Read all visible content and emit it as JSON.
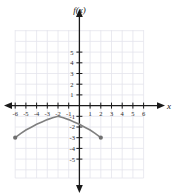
{
  "figure": {
    "title": "f(x)",
    "x_axis_label": "x",
    "background": "#ffffff",
    "grid_color": "#e2e2ea",
    "axis_color": "#1a1a1a",
    "curve_color": "#808080"
  },
  "axes": {
    "x_ticks": [
      "-6",
      "-5",
      "-4",
      "-3",
      "-2",
      "-1",
      "1",
      "2",
      "3",
      "4",
      "5",
      "6"
    ],
    "y_ticks": [
      "5",
      "4",
      "3",
      "2",
      "1",
      "-1",
      "-2",
      "-3",
      "-4",
      "-5"
    ],
    "xlim": [
      -6.5,
      6.5
    ],
    "ylim": [
      -6.0,
      6.0
    ],
    "grid": true
  },
  "chart_data": {
    "type": "line",
    "title": "f(x)",
    "xlabel": "x",
    "ylabel": "f(x)",
    "xlim": [
      -6.5,
      6.5
    ],
    "ylim": [
      -6.0,
      6.0
    ],
    "grid": true,
    "legend": null,
    "categories": null,
    "series": [
      {
        "name": "f(x)",
        "shape": "downward parabola arc",
        "vertex": [
          -2,
          -1
        ],
        "domain": [
          -6,
          2
        ],
        "range": [
          -3,
          -1
        ],
        "endpoints": [
          [
            -6,
            -3
          ],
          [
            2,
            -3
          ]
        ],
        "endpoint_style": "closed-filled-dot",
        "x": [
          -6,
          -5.5,
          -5,
          -4.5,
          -4,
          -3.5,
          -3,
          -2.5,
          -2,
          -1.5,
          -1,
          -0.5,
          0,
          0.5,
          1,
          1.5,
          2
        ],
        "y": [
          -3,
          -2.61,
          -2.28,
          -2.02,
          -1.75,
          -1.53,
          -1.31,
          -1.14,
          -1.0,
          -1.14,
          -1.31,
          -1.53,
          -1.75,
          -2.02,
          -2.28,
          -2.61,
          -3
        ]
      }
    ]
  }
}
